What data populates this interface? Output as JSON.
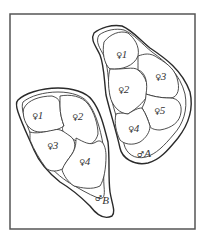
{
  "diagram": {
    "type": "territory-map",
    "frame": {
      "stroke": "#555555"
    },
    "territories": [
      {
        "id": "male-A",
        "label": "A",
        "symbol": "♂",
        "females": [
          {
            "symbol": "♀",
            "label": "1"
          },
          {
            "symbol": "♀",
            "label": "2"
          },
          {
            "symbol": "♀",
            "label": "3"
          },
          {
            "symbol": "♀",
            "label": "4"
          },
          {
            "symbol": "♀",
            "label": "5"
          }
        ]
      },
      {
        "id": "male-B",
        "label": "B",
        "symbol": "♂",
        "females": [
          {
            "symbol": "♀",
            "label": "1"
          },
          {
            "symbol": "♀",
            "label": "2"
          },
          {
            "symbol": "♀",
            "label": "3"
          },
          {
            "symbol": "♀",
            "label": "4"
          }
        ]
      }
    ]
  }
}
